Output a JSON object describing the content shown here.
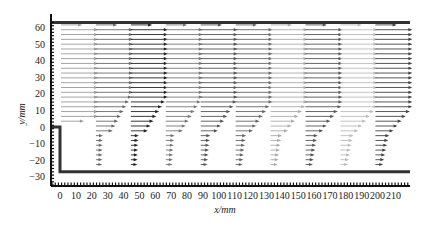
{
  "chart_data": {
    "type": "quiver",
    "title": "",
    "xlabel": "x/mm",
    "ylabel": "y/mm",
    "xlim": [
      -5,
      220
    ],
    "ylim": [
      -35,
      64
    ],
    "grid": false,
    "legend": null,
    "x_ticks": [
      0,
      10,
      20,
      30,
      40,
      50,
      60,
      70,
      80,
      90,
      100,
      110,
      120,
      130,
      140,
      150,
      160,
      170,
      180,
      190,
      200,
      210
    ],
    "x_tick_labels": [
      "0",
      "10",
      "20",
      "30",
      "40",
      "50",
      "60",
      "70",
      "80",
      "90",
      "100",
      "110",
      "120",
      "130",
      "140",
      "150",
      "160",
      "170",
      "180",
      "190",
      "200",
      "210"
    ],
    "y_ticks": [
      60,
      50,
      40,
      30,
      20,
      10,
      0,
      -10,
      -20,
      -30
    ],
    "y_tick_labels": [
      "60",
      "50",
      "40",
      "30",
      "20",
      "10",
      "0",
      "-10",
      "-20",
      "-30"
    ],
    "geometry": {
      "top_wall_y": 63,
      "step_wall": {
        "x": 0,
        "y_top": 0,
        "y_bottom": -27
      },
      "bottom_wall_y": -27,
      "x_end": 220
    },
    "profiles": [
      {
        "x0": 0,
        "shade": "#9a9a9a",
        "y_min": 2,
        "max_len": 22,
        "upstream": true
      },
      {
        "x0": 22,
        "shade": "#6a6a6a",
        "y_min": -25,
        "max_len": 22
      },
      {
        "x0": 44,
        "shade": "#222222",
        "y_min": -25,
        "max_len": 22
      },
      {
        "x0": 66,
        "shade": "#777777",
        "y_min": -25,
        "max_len": 22
      },
      {
        "x0": 88,
        "shade": "#555555",
        "y_min": -25,
        "max_len": 22
      },
      {
        "x0": 110,
        "shade": "#666666",
        "y_min": -25,
        "max_len": 22
      },
      {
        "x0": 132,
        "shade": "#aaaaaa",
        "y_min": -25,
        "max_len": 22
      },
      {
        "x0": 154,
        "shade": "#555555",
        "y_min": -25,
        "max_len": 22
      },
      {
        "x0": 176,
        "shade": "#bbbbbb",
        "y_min": -25,
        "max_len": 22
      },
      {
        "x0": 198,
        "shade": "#444444",
        "y_min": -25,
        "max_len": 22
      }
    ],
    "arrow_spacing_y": 2.9
  }
}
